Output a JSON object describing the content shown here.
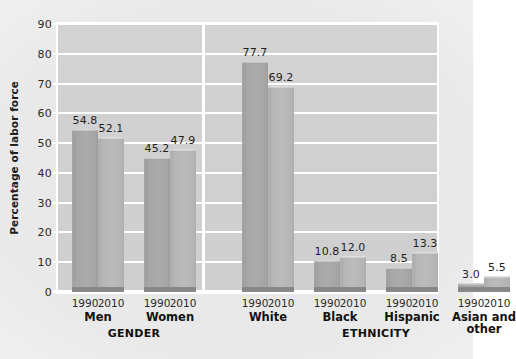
{
  "chart_data": {
    "type": "bar",
    "title": "",
    "xlabel": "",
    "ylabel": "Percentage of labor force",
    "ylim": [
      0,
      90
    ],
    "ytick_step": 10,
    "ytick_labels": [
      "90",
      "80",
      "70",
      "60",
      "50",
      "40",
      "30",
      "20",
      "10",
      "0"
    ],
    "grid": true,
    "legend": "none",
    "series": [
      {
        "name": "1990",
        "values": [
          54.8,
          45.2,
          77.7,
          10.8,
          8.5,
          3.0
        ]
      },
      {
        "name": "2010",
        "values": [
          52.1,
          47.9,
          69.2,
          12.0,
          13.3,
          5.5
        ]
      }
    ],
    "categories": [
      "Men",
      "Women",
      "White",
      "Black",
      "Hispanic",
      "Asian and other"
    ],
    "sections": [
      {
        "label": "GENDER",
        "groups": [
          {
            "category": "Men",
            "bars": [
              {
                "year": "1990",
                "value": 54.8,
                "label": "54.8"
              },
              {
                "year": "2010",
                "value": 52.1,
                "label": "52.1"
              }
            ]
          },
          {
            "category": "Women",
            "bars": [
              {
                "year": "1990",
                "value": 45.2,
                "label": "45.2"
              },
              {
                "year": "2010",
                "value": 47.9,
                "label": "47.9"
              }
            ]
          }
        ]
      },
      {
        "label": "ETHNICITY",
        "groups": [
          {
            "category": "White",
            "bars": [
              {
                "year": "1990",
                "value": 77.7,
                "label": "77.7"
              },
              {
                "year": "2010",
                "value": 69.2,
                "label": "69.2"
              }
            ]
          },
          {
            "category": "Black",
            "bars": [
              {
                "year": "1990",
                "value": 10.8,
                "label": "10.8"
              },
              {
                "year": "2010",
                "value": 12.0,
                "label": "12.0"
              }
            ]
          },
          {
            "category": "Hispanic",
            "bars": [
              {
                "year": "1990",
                "value": 8.5,
                "label": "8.5"
              },
              {
                "year": "2010",
                "value": 13.3,
                "label": "13.3"
              }
            ]
          },
          {
            "category": "Asian and other",
            "category_line1": "Asian and",
            "category_line2": "other",
            "bars": [
              {
                "year": "1990",
                "value": 3.0,
                "label": "3.0"
              },
              {
                "year": "2010",
                "value": 5.5,
                "label": "5.5"
              }
            ]
          }
        ]
      }
    ],
    "colors": {
      "bar_1990": "#a6a6a6",
      "bar_2010": "#b6b6b6",
      "bar_base": "#878787",
      "plot_background": "#d1d1d1",
      "gridline": "#ffffff",
      "text": "#1f1f1f"
    }
  }
}
